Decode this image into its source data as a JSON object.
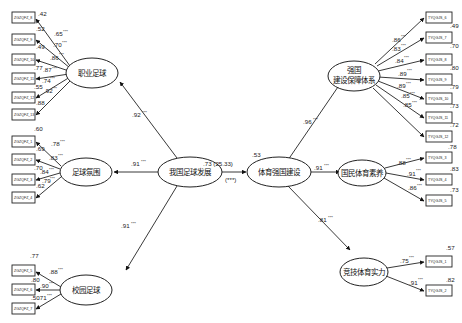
{
  "diagram": {
    "type": "structural-equation-model",
    "central_link": {
      "from": "我国足球发展",
      "to": "体育强国建设",
      "label": ".73 (25.33)",
      "sig": "(***)",
      "r2_target": ".53"
    },
    "latents": {
      "football_dev": "我国足球发展",
      "pro_football": "职业足球",
      "atmosphere": "足球氛围",
      "campus": "校园足球",
      "sports_power": "体育强国建设",
      "guarantee_l1": "强国",
      "guarantee_l2": "建设保障体系",
      "literacy": "国民体育素养",
      "competitive": "竞技体育实力"
    },
    "second_order_left": [
      {
        "target": "职业足球",
        "loading": ".92",
        "sig": "***"
      },
      {
        "target": "足球氛围",
        "loading": ".91",
        "sig": "***"
      },
      {
        "target": "校园足球",
        "loading": ".91",
        "sig": "***"
      }
    ],
    "second_order_right": [
      {
        "target": "强国建设保障体系",
        "loading": ".96",
        "sig": "***"
      },
      {
        "target": "国民体育素养",
        "loading": ".91",
        "sig": "***"
      },
      {
        "target": "竞技体育实力",
        "loading": ".81",
        "sig": "***"
      }
    ],
    "indicators": {
      "pro_football": [
        {
          "name": "ZGZQFZ_8",
          "loading": ".65",
          "sig": "***",
          "r2": ".42"
        },
        {
          "name": "ZGZQFZ_9",
          "loading": ".70",
          "sig": "***",
          "r2": ".52"
        },
        {
          "name": "ZGZQFZ_10",
          "loading": ".86",
          "sig": "***",
          "r2": ".49"
        },
        {
          "name": "ZGZQFZ_11",
          "loading": ".87",
          "sig": "***",
          "r2": ".77"
        },
        {
          "name": "ZGZQFZ_12",
          "loading": ".74",
          "sig": "***",
          "r2": ".55"
        },
        {
          "name": "ZGZQFZ_13",
          "loading": ".92",
          "sig": "***",
          "r2": ".88"
        }
      ],
      "atmosphere": [
        {
          "name": "ZGZQFZ_1",
          "loading": ".78",
          "sig": "***",
          "r2": ".60"
        },
        {
          "name": "ZGZQFZ_2",
          "loading": ".83",
          "sig": "***",
          "r2": ".69"
        },
        {
          "name": "ZGZQFZ_3",
          "loading": ".84",
          "sig": "***",
          "r2": ".70"
        },
        {
          "name": "ZGZQFZ_4",
          "loading": ".79",
          "sig": "***",
          "r2": ".62"
        }
      ],
      "campus": [
        {
          "name": "ZGZQFZ_5",
          "loading": ".88",
          "sig": "***",
          "r2": ".77"
        },
        {
          "name": "ZGZQFZ_6",
          "loading": ".90",
          "sig": "***",
          "r2": ".80"
        },
        {
          "name": "ZGZQFZ_7",
          "loading": ".71",
          "sig": "***",
          "r2": ".50"
        }
      ],
      "guarantee": [
        {
          "name": "TYQGJS_6",
          "loading": ".86",
          "sig": "***",
          "r2": ".49"
        },
        {
          "name": "TYQGJS_7",
          "loading": ".83",
          "sig": "***",
          "r2": ".70"
        },
        {
          "name": "TYQGJS_8",
          "loading": ".84",
          "sig": "***",
          "r2": ".80"
        },
        {
          "name": "TYQGJS_9",
          "loading": ".89",
          "sig": "***",
          "r2": ".79"
        },
        {
          "name": "TYQGJS_10",
          "loading": ".89",
          "sig": "***",
          "r2": ".73"
        },
        {
          "name": "TYQGJS_11",
          "loading": ".85",
          "sig": "***",
          "r2": ".72"
        },
        {
          "name": "TYQGJS_12",
          "loading": ".85",
          "sig": "***",
          "r2": ""
        }
      ],
      "literacy": [
        {
          "name": "TYQGJS_3",
          "loading": ".88",
          "sig": "***",
          "r2": ".78"
        },
        {
          "name": "TYQGJS_4",
          "loading": ".91",
          "sig": "***",
          "r2": ".83"
        },
        {
          "name": "TYQGJS_5",
          "loading": ".86",
          "sig": "***",
          "r2": ".73"
        }
      ],
      "competitive": [
        {
          "name": "TYQGJS_1",
          "loading": ".75",
          "sig": "***",
          "r2": ".57"
        },
        {
          "name": "TYQGJS_2",
          "loading": ".91",
          "sig": "***",
          "r2": ".82"
        }
      ]
    }
  }
}
